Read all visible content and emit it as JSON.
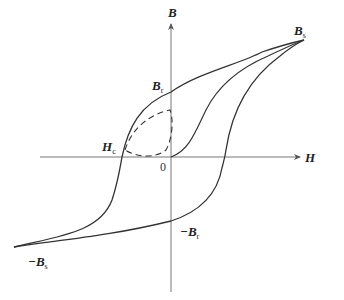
{
  "diagram": {
    "type": "magnetic hysteresis loop (B-H curve)",
    "axes": {
      "horizontal": {
        "label": "H"
      },
      "vertical": {
        "label": "B"
      },
      "origin_label": "0"
    },
    "labels": {
      "saturation_pos": {
        "main": "B",
        "sub": "s"
      },
      "saturation_neg": {
        "main": "−B",
        "sub": "s"
      },
      "remanence_pos": {
        "main": "B",
        "sub": "r"
      },
      "remanence_neg": {
        "main": "−B",
        "sub": "r"
      },
      "coercivity": {
        "main": "H",
        "sub": "c"
      }
    },
    "curves": [
      {
        "name": "major-loop-upper-branch",
        "style": "solid"
      },
      {
        "name": "major-loop-lower-branch",
        "style": "solid"
      },
      {
        "name": "initial-magnetization-curve",
        "style": "solid"
      },
      {
        "name": "minor-loop",
        "style": "dashed"
      }
    ],
    "colors": {
      "line": "#333333",
      "text": "#222222",
      "background": "#ffffff"
    }
  }
}
